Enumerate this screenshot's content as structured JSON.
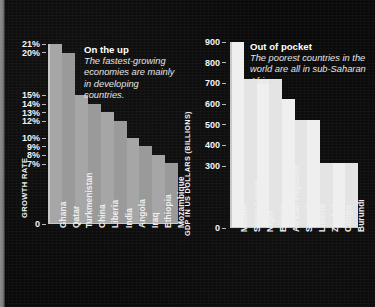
{
  "chart_data": [
    {
      "type": "bar",
      "title": "On the up",
      "subtitle": "The fastest-growing economies are mainly in developing countries.",
      "xlabel": "",
      "ylabel": "GROWTH RATE",
      "ylim": [
        0,
        21
      ],
      "grid": false,
      "unit": "%",
      "legend_position": "none",
      "ytick_labels": [
        "21%",
        "20%",
        "15%",
        "14%",
        "13%",
        "12%",
        "10%",
        "9%",
        "8%",
        "7%",
        "0"
      ],
      "ytick_values": [
        21,
        20,
        15,
        14,
        13,
        12,
        10,
        9,
        8,
        7,
        0
      ],
      "categories": [
        "Ghana",
        "Qatar",
        "Turkmenistan",
        "China",
        "Liberia",
        "India",
        "Angola",
        "Iraq",
        "Ethiopia",
        "Mozambique"
      ],
      "values": [
        21,
        20,
        15,
        14,
        13,
        12,
        10,
        9,
        8,
        7
      ],
      "bar_colors": [
        "#a6a6a6",
        "#9a9a9a",
        "#a6a6a6",
        "#9a9a9a",
        "#a6a6a6",
        "#9a9a9a",
        "#a6a6a6",
        "#9a9a9a",
        "#a6a6a6",
        "#9a9a9a"
      ]
    },
    {
      "type": "bar",
      "title": "Out of pocket",
      "subtitle": "The poorest countries in the world are all in sub-Saharan Africa.",
      "xlabel": "",
      "ylabel": "GDP IN US DOLLARS (BILLIONS)",
      "ylim": [
        0,
        900
      ],
      "grid": false,
      "unit": "",
      "legend_position": "none",
      "ytick_labels": [
        "900",
        "800",
        "700",
        "600",
        "500",
        "400",
        "300",
        "0"
      ],
      "ytick_values": [
        900,
        800,
        700,
        600,
        500,
        400,
        300,
        0
      ],
      "categories": [
        "Malawi",
        "Sierra Leone",
        "Niger",
        "Eritrea",
        "African Republic",
        "Somalia",
        "Liberia",
        "Zimbabwe",
        "Congo",
        "Burundi"
      ],
      "values": [
        900,
        720,
        720,
        720,
        620,
        520,
        520,
        310,
        310,
        310
      ],
      "bar_colors": [
        "#efefef",
        "#e4e4e4",
        "#efefef",
        "#e4e4e4",
        "#efefef",
        "#e4e4e4",
        "#efefef",
        "#e4e4e4",
        "#efefef",
        "#e4e4e4"
      ]
    }
  ],
  "colors": {
    "background": "#0a0a0a",
    "axis": "#c9c9c9",
    "text": "#f2f2f2",
    "note_body": "#e4e4e4",
    "edge_strip": "#8c8c8c"
  }
}
